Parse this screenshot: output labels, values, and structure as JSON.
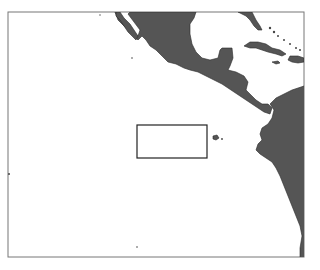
{
  "map": {
    "region": "Eastern Pacific / Central America",
    "land_color": "#555555",
    "ocean_color": "#ffffff",
    "frame_color": "#777777",
    "highlight_box": {
      "label": "study-area",
      "color": "#222222"
    },
    "features": [
      {
        "name": "Mexico"
      },
      {
        "name": "Baja California"
      },
      {
        "name": "Florida"
      },
      {
        "name": "Cuba"
      },
      {
        "name": "Hispaniola"
      },
      {
        "name": "Jamaica"
      },
      {
        "name": "Bahamas"
      },
      {
        "name": "Central America"
      },
      {
        "name": "South America"
      },
      {
        "name": "Galapagos Islands"
      }
    ]
  }
}
